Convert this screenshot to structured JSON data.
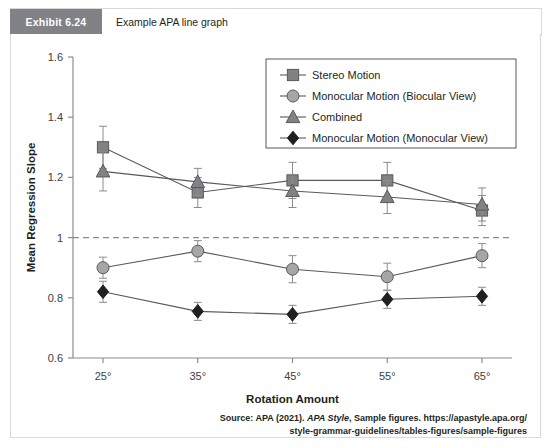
{
  "exhibit": {
    "tag": "Exhibit 6.24",
    "title": "Example APA line graph",
    "tag_bg": "#808285",
    "tag_fg": "#ffffff"
  },
  "source": {
    "line1_a": "Source: APA (2021). ",
    "line1_em": "APA Style",
    "line1_b": ", Sample figures. https://apastyle.apa.org/",
    "line2": "style-grammar-guidelines/tables-figures/sample-figures"
  },
  "chart_data": {
    "type": "line",
    "title": "",
    "xlabel": "Rotation Amount",
    "ylabel": "Mean Regression Slope",
    "categories": [
      "25°",
      "35°",
      "45°",
      "55°",
      "65°"
    ],
    "x": [
      25,
      35,
      45,
      55,
      65
    ],
    "ylim": [
      0.6,
      1.6
    ],
    "yticks": [
      0.6,
      0.8,
      1,
      1.2,
      1.4,
      1.6
    ],
    "ytick_labels": [
      "0.6",
      "0.8",
      "1",
      "1.2",
      "1.4",
      "1.6"
    ],
    "grid": false,
    "reference_line": {
      "value": 1,
      "style": "dashed",
      "color": "#8c8c8c"
    },
    "legend_position": "top-right",
    "series": [
      {
        "name": "Stereo Motion",
        "marker": "square",
        "color": "#808285",
        "line_color": "#595959",
        "values": [
          1.3,
          1.15,
          1.19,
          1.19,
          1.09
        ],
        "errors": [
          0.07,
          0.05,
          0.06,
          0.06,
          0.05
        ]
      },
      {
        "name": "Monocular Motion (Biocular View)",
        "marker": "circle",
        "color": "#a6a6a6",
        "line_color": "#595959",
        "values": [
          0.9,
          0.955,
          0.895,
          0.87,
          0.94
        ],
        "errors": [
          0.035,
          0.035,
          0.045,
          0.045,
          0.04
        ]
      },
      {
        "name": "Combined",
        "marker": "triangle",
        "color": "#808285",
        "line_color": "#595959",
        "values": [
          1.22,
          1.185,
          1.155,
          1.135,
          1.11
        ],
        "errors": [
          0.065,
          0.045,
          0.055,
          0.055,
          0.055
        ]
      },
      {
        "name": "Monocular Motion (Monocular View)",
        "marker": "diamond",
        "color": "#231f20",
        "line_color": "#595959",
        "values": [
          0.82,
          0.755,
          0.745,
          0.795,
          0.805
        ],
        "errors": [
          0.035,
          0.03,
          0.03,
          0.03,
          0.03
        ]
      }
    ]
  }
}
